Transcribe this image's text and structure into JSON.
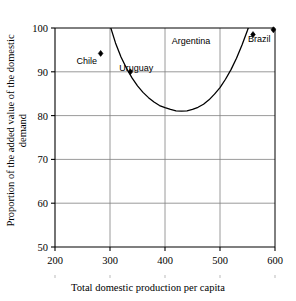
{
  "chart_data": {
    "type": "scatter",
    "title": "",
    "xlabel": "Total domestic production per capita",
    "ylabel_line1": "Proportion of the added value of the domestic",
    "ylabel_line2": "demand",
    "xlim": [
      200,
      600
    ],
    "ylim": [
      50,
      100
    ],
    "xticks": [
      200,
      300,
      400,
      500,
      600
    ],
    "yticks": [
      50,
      60,
      70,
      80,
      90,
      100
    ],
    "grid": true,
    "legend": "none",
    "points": [
      {
        "name": "Chile",
        "x": 283,
        "y": 94.2,
        "label_dx": -14,
        "label_dy": 11
      },
      {
        "name": "Uruguay",
        "x": 337,
        "y": 90.0,
        "label_dx": 6,
        "label_dy": -1
      },
      {
        "name": "Argentina",
        "x": 560,
        "y": 98.5,
        "label_dx": -62,
        "label_dy": 9
      },
      {
        "name": "Brazil",
        "x": 597,
        "y": 99.6,
        "label_dx": -14,
        "label_dy": 12
      }
    ],
    "curve": {
      "description": "U-shaped fitted curve, minimum near x=430 at y=81",
      "min_x": 430,
      "min_y": 81,
      "x": [
        293,
        300,
        310,
        320,
        330,
        340,
        350,
        360,
        370,
        380,
        390,
        400,
        410,
        420,
        430,
        440,
        450,
        460,
        470,
        480,
        490,
        500,
        510,
        520,
        530,
        540,
        550,
        560,
        566
      ],
      "y": [
        104.0,
        100.6,
        96.6,
        93.4,
        90.8,
        88.6,
        86.8,
        85.3,
        84.1,
        83.1,
        82.3,
        81.8,
        81.4,
        81.1,
        81.0,
        81.1,
        81.4,
        81.9,
        82.6,
        83.6,
        84.9,
        86.4,
        88.3,
        90.5,
        93.1,
        96.1,
        99.5,
        103.2,
        105.5
      ]
    },
    "colors": {
      "axis": "#000000",
      "grid": "#808080",
      "curve": "#000000",
      "marker": "#000000",
      "background": "#ffffff"
    }
  }
}
